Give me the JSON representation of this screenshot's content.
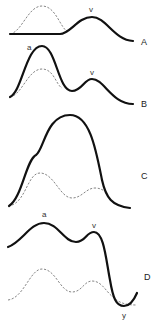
{
  "figure": {
    "panels": [
      {
        "id": "A",
        "label": "A",
        "peak_labels": [
          {
            "text": "v",
            "x": 91,
            "y": 12
          }
        ],
        "label_pos": {
          "x": 141,
          "y": 45
        }
      },
      {
        "id": "B",
        "label": "B",
        "peak_labels": [
          {
            "text": "a",
            "x": 29,
            "y": 50
          },
          {
            "text": "v",
            "x": 92,
            "y": 75
          }
        ],
        "label_pos": {
          "x": 141,
          "y": 107
        }
      },
      {
        "id": "C",
        "label": "C",
        "peak_labels": [],
        "label_pos": {
          "x": 141,
          "y": 179
        }
      },
      {
        "id": "D",
        "label": "D",
        "peak_labels": [
          {
            "text": "a",
            "x": 43,
            "y": 217
          },
          {
            "text": "v",
            "x": 92,
            "y": 228
          },
          {
            "text": "y",
            "x": 122,
            "y": 318
          }
        ],
        "label_pos": {
          "x": 144,
          "y": 280
        }
      }
    ],
    "colors": {
      "solid": "#111111",
      "dashed": "#777777",
      "background": "#ffffff"
    }
  }
}
